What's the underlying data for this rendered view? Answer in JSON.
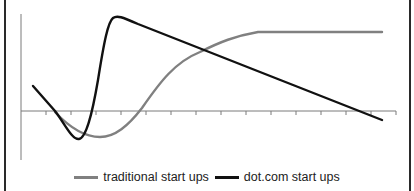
{
  "chart_data": {
    "type": "line",
    "title": "",
    "xlabel": "",
    "ylabel": "",
    "x_ticks_count": 15,
    "x_tick_labels": [],
    "y_tick_labels": [],
    "grid": false,
    "legend_position": "bottom",
    "x": [
      0,
      1,
      2,
      3,
      4,
      5,
      6,
      7,
      8,
      9,
      10,
      11,
      12,
      13,
      14
    ],
    "series": [
      {
        "name": "traditional start ups",
        "color": "#808080",
        "values": [
          null,
          -0.2,
          -0.9,
          -1.0,
          -0.6,
          0.1,
          1.1,
          1.9,
          2.3,
          2.6,
          2.6,
          2.6,
          2.6,
          2.6,
          2.6
        ]
      },
      {
        "name": "dot.com start ups",
        "color": "#111111",
        "values": [
          0.9,
          -0.2,
          -1.0,
          3.2,
          3.0,
          2.6,
          2.2,
          1.8,
          1.4,
          1.1,
          0.8,
          0.5,
          0.2,
          -0.1,
          -0.3
        ]
      }
    ],
    "axis_origin": "horizontal axis crosses vertical axis at zero, zero-line mid-height"
  },
  "legend": {
    "items": [
      {
        "label": "traditional start ups",
        "color": "#808080"
      },
      {
        "label": "dot.com start ups",
        "color": "#111111"
      }
    ]
  },
  "paths": {
    "traditional": "M 55 112 C 70 128, 85 137, 100 137 C 115 137, 128 126, 142 108 C 160 82, 175 62, 200 52 C 220 42, 235 36, 258 32 L 382 32",
    "dotcom": "M 33 86 L 55 111 C 65 124, 72 140, 79 139 C 86 138, 92 115, 98 80 C 104 42, 108 22, 113 18 C 117 15, 122 17, 138 24 L 382 120"
  },
  "axes": {
    "y_axis": {
      "x": 21,
      "y1": 14,
      "y2": 160
    },
    "x_axis": {
      "y": 111,
      "x1": 21,
      "x2": 396
    },
    "tick_xs": [
      46,
      71,
      96,
      121,
      146,
      171,
      196,
      221,
      246,
      271,
      296,
      321,
      346,
      371,
      396
    ]
  }
}
